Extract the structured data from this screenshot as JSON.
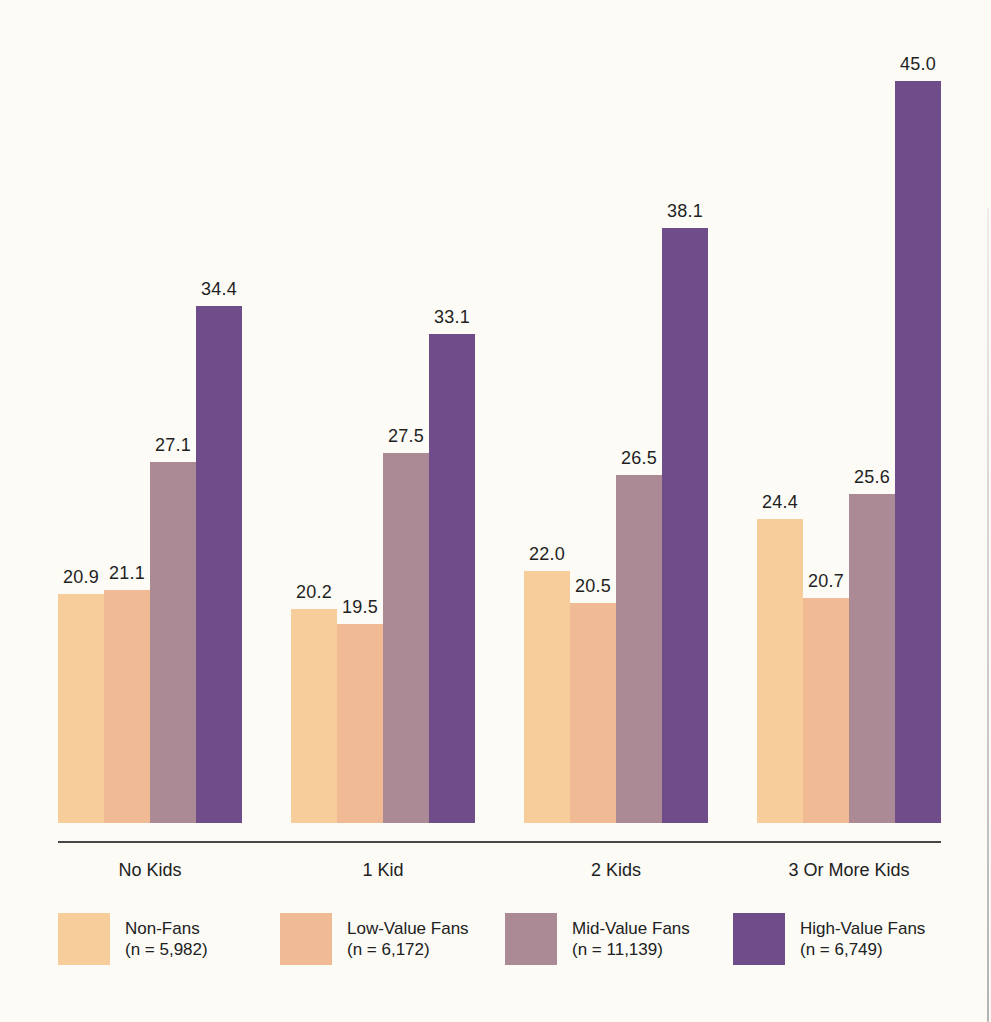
{
  "chart_data": {
    "type": "bar",
    "categories": [
      "No Kids",
      "1 Kid",
      "2 Kids",
      "3 Or More Kids"
    ],
    "series": [
      {
        "name": "Non-Fans",
        "legend_n": "(n = 5,982)",
        "color": "#F7CE9B",
        "values": [
          20.9,
          20.2,
          22.0,
          24.4
        ]
      },
      {
        "name": "Low-Value Fans",
        "legend_n": "(n = 6,172)",
        "color": "#F0BA95",
        "values": [
          21.1,
          19.5,
          20.5,
          20.7
        ]
      },
      {
        "name": "Mid-Value Fans",
        "legend_n": "(n = 11,139)",
        "color": "#AC8A95",
        "values": [
          27.1,
          27.5,
          26.5,
          25.6
        ]
      },
      {
        "name": "High-Value Fans",
        "legend_n": "(n = 6,749)",
        "color": "#6F4D8A",
        "values": [
          34.4,
          33.1,
          38.1,
          45.0
        ]
      }
    ],
    "title": "",
    "xlabel": "",
    "ylabel": "",
    "value_label_format": "one-decimal",
    "axis": {
      "value_axis_visible": false,
      "gridlines": false,
      "effective_baseline_value": 10.15,
      "px_per_unit": 21.3,
      "ylim": [
        10.15,
        46
      ]
    },
    "legend_position": "bottom"
  },
  "layout_colors": {
    "text": "#1F1F1F",
    "axis_line": "#47474A",
    "background": "#FCFBF6"
  }
}
